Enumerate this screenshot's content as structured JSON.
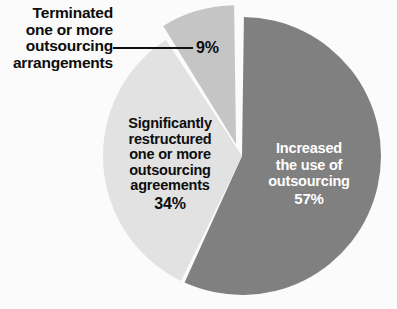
{
  "chart_data": {
    "type": "pie",
    "title": "",
    "subtitle": "",
    "xlabel": "",
    "ylabel": "",
    "legend_position": "none",
    "grid": false,
    "units": "percent",
    "categories": [
      "Increased the use of outsourcing",
      "Significantly restructured one or more outsourcing agreements",
      "Terminated one or more outsourcing arrangements"
    ],
    "values": [
      57,
      34,
      9
    ],
    "value_labels": [
      "57%",
      "34%",
      "9%"
    ],
    "colors": [
      "#808080",
      "#e2e2e2",
      "#c5c5c5"
    ],
    "slices": [
      {
        "name": "Increased the use of outsourcing",
        "value": 57,
        "value_label": "57%",
        "color": "#808080",
        "label_placement": "inside",
        "label_color": "#ffffff",
        "exploded": false
      },
      {
        "name": "Significantly restructured one or more outsourcing agreements",
        "value": 34,
        "value_label": "34%",
        "color": "#e2e2e2",
        "label_placement": "inside",
        "label_color": "#0d0d0d",
        "exploded": false
      },
      {
        "name": "Terminated one or more outsourcing arrangements",
        "value": 9,
        "value_label": "9%",
        "color": "#c5c5c5",
        "label_placement": "callout",
        "label_color": "#0d0d0d",
        "exploded": true
      }
    ]
  },
  "labels": {
    "terminated": {
      "line1": "Terminated",
      "line2": "one or more",
      "line3": "outsourcing",
      "line4": "arrangements",
      "value": "9%"
    },
    "restructured": {
      "line1": "Significantly",
      "line2": "restructured",
      "line3": "one or more",
      "line4": "outsourcing",
      "line5": "agreements",
      "value": "34%"
    },
    "increased": {
      "line1": "Increased",
      "line2": "the use of",
      "line3": "outsourcing",
      "value": "57%"
    }
  },
  "style": {
    "background": "#fbfbfb",
    "separator": "#ffffff",
    "leader_line": "#111111"
  }
}
